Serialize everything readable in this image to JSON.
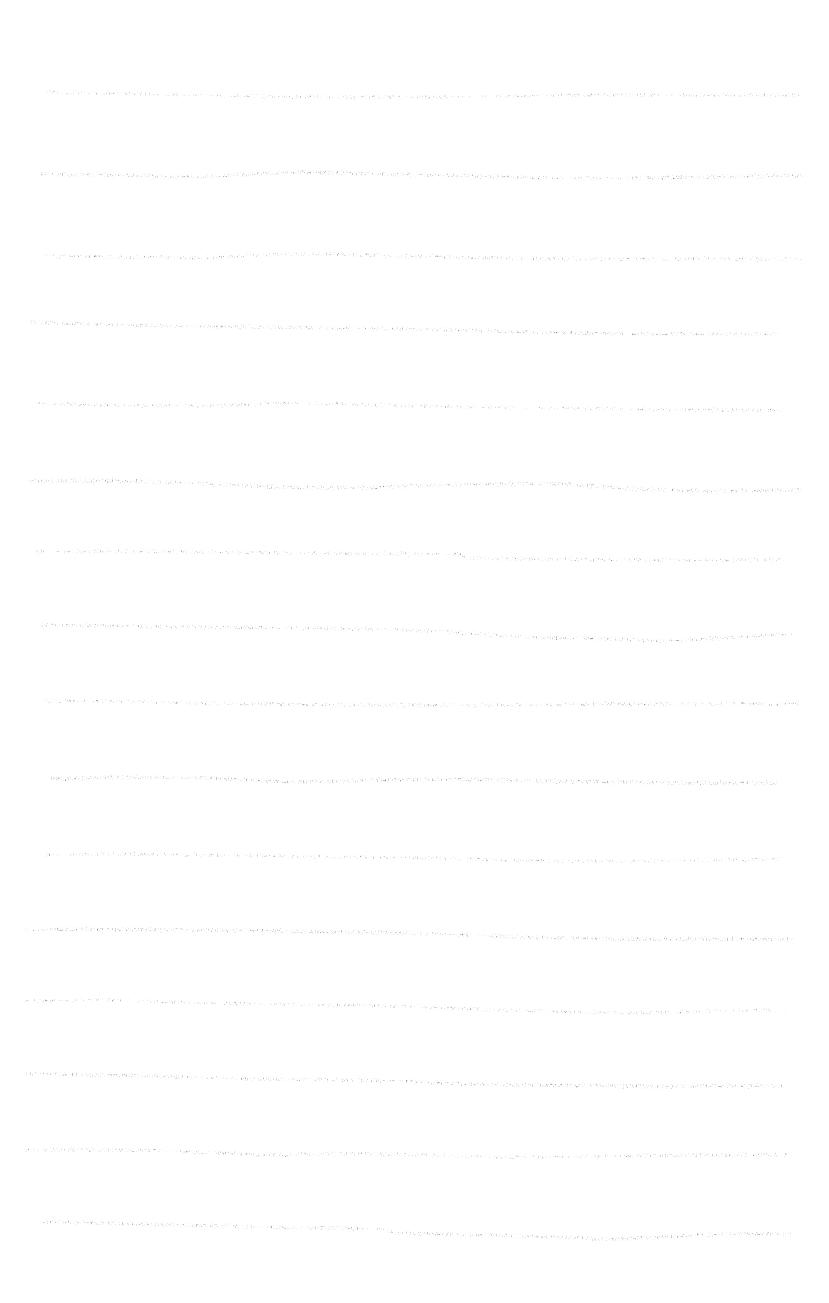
{
  "page": {
    "width": 829,
    "height": 1303,
    "background_color": "#ffffff",
    "ink_color": "#3a3a3a",
    "medium": "pencil-on-paper scan",
    "line_count": 16
  },
  "chart_data": {
    "type": "line",
    "xlabel": "",
    "ylabel": "",
    "xlim": [
      0,
      829
    ],
    "ylim": [
      0,
      1303
    ],
    "grid": false,
    "legend": "none",
    "series": [
      {
        "name": "rule-1",
        "index": 1,
        "y_baseline": 95,
        "x_start": 48,
        "x_end": 800,
        "stroke_width": 2.6,
        "opacity": 0.92,
        "points": [
          [
            48,
            92
          ],
          [
            70,
            93
          ],
          [
            150,
            94
          ],
          [
            240,
            96
          ],
          [
            330,
            97
          ],
          [
            420,
            97
          ],
          [
            500,
            96
          ],
          [
            580,
            95
          ],
          [
            660,
            95
          ],
          [
            740,
            95
          ],
          [
            800,
            95
          ]
        ],
        "gaps": [
          [
            178,
            232
          ],
          [
            455,
            500
          ],
          [
            530,
            548
          ]
        ],
        "lead_dashes": [
          [
            48,
            56
          ],
          [
            62,
            70
          ]
        ]
      },
      {
        "name": "rule-2",
        "index": 2,
        "y_baseline": 177,
        "x_start": 42,
        "x_end": 802,
        "stroke_width": 2.9,
        "opacity": 0.95,
        "points": [
          [
            42,
            174
          ],
          [
            110,
            175
          ],
          [
            190,
            177
          ],
          [
            250,
            174
          ],
          [
            300,
            172
          ],
          [
            380,
            174
          ],
          [
            470,
            176
          ],
          [
            540,
            178
          ],
          [
            620,
            178
          ],
          [
            700,
            177
          ],
          [
            760,
            176
          ],
          [
            802,
            176
          ]
        ],
        "gaps": [
          [
            545,
            575
          ],
          [
            598,
            620
          ]
        ],
        "lead_dashes": []
      },
      {
        "name": "rule-3",
        "index": 3,
        "y_baseline": 258,
        "x_start": 44,
        "x_end": 800,
        "stroke_width": 2.8,
        "opacity": 0.94,
        "points": [
          [
            44,
            256
          ],
          [
            120,
            257
          ],
          [
            200,
            258
          ],
          [
            265,
            255
          ],
          [
            320,
            254
          ],
          [
            400,
            256
          ],
          [
            490,
            258
          ],
          [
            570,
            259
          ],
          [
            650,
            259
          ],
          [
            730,
            259
          ],
          [
            800,
            259
          ]
        ],
        "gaps": [],
        "lead_dashes": []
      },
      {
        "name": "rule-4",
        "index": 4,
        "y_baseline": 326,
        "x_start": 30,
        "x_end": 780,
        "stroke_width": 2.6,
        "opacity": 0.9,
        "points": [
          [
            30,
            322
          ],
          [
            90,
            324
          ],
          [
            170,
            326
          ],
          [
            250,
            327
          ],
          [
            330,
            328
          ],
          [
            410,
            329
          ],
          [
            490,
            331
          ],
          [
            570,
            333
          ],
          [
            650,
            334
          ],
          [
            720,
            334
          ],
          [
            780,
            334
          ]
        ],
        "gaps": [
          [
            118,
            136
          ],
          [
            176,
            198
          ],
          [
            352,
            372
          ]
        ],
        "lead_dashes": []
      },
      {
        "name": "rule-5",
        "index": 5,
        "y_baseline": 406,
        "x_start": 38,
        "x_end": 782,
        "stroke_width": 2.7,
        "opacity": 0.93,
        "points": [
          [
            38,
            404
          ],
          [
            110,
            405
          ],
          [
            190,
            406
          ],
          [
            262,
            404
          ],
          [
            300,
            403
          ],
          [
            380,
            405
          ],
          [
            460,
            407
          ],
          [
            540,
            408
          ],
          [
            620,
            409
          ],
          [
            700,
            410
          ],
          [
            782,
            410
          ]
        ],
        "gaps": [
          [
            48,
            62
          ],
          [
            528,
            548
          ]
        ],
        "lead_dashes": [
          [
            38,
            46
          ]
        ]
      },
      {
        "name": "rule-6",
        "index": 6,
        "y_baseline": 483,
        "x_start": 30,
        "x_end": 800,
        "stroke_width": 3.0,
        "opacity": 0.95,
        "points": [
          [
            30,
            481
          ],
          [
            110,
            481
          ],
          [
            190,
            483
          ],
          [
            280,
            487
          ],
          [
            360,
            488
          ],
          [
            430,
            485
          ],
          [
            500,
            484
          ],
          [
            560,
            484
          ],
          [
            640,
            489
          ],
          [
            720,
            491
          ],
          [
            800,
            490
          ]
        ],
        "gaps": [
          [
            175,
            196
          ],
          [
            345,
            362
          ]
        ],
        "lead_dashes": [
          [
            30,
            40
          ]
        ]
      },
      {
        "name": "rule-7",
        "index": 7,
        "y_baseline": 555,
        "x_start": 36,
        "x_end": 782,
        "stroke_width": 2.8,
        "opacity": 0.94,
        "points": [
          [
            36,
            552
          ],
          [
            110,
            551
          ],
          [
            200,
            552
          ],
          [
            290,
            553
          ],
          [
            380,
            554
          ],
          [
            455,
            554
          ],
          [
            470,
            558
          ],
          [
            540,
            559
          ],
          [
            620,
            560
          ],
          [
            700,
            560
          ],
          [
            782,
            560
          ]
        ],
        "gaps": [
          [
            50,
            66
          ],
          [
            290,
            312
          ],
          [
            420,
            452
          ]
        ],
        "lead_dashes": [
          [
            36,
            46
          ]
        ]
      },
      {
        "name": "rule-8",
        "index": 8,
        "y_baseline": 628,
        "x_start": 42,
        "x_end": 790,
        "stroke_width": 2.7,
        "opacity": 0.92,
        "points": [
          [
            42,
            625
          ],
          [
            120,
            626
          ],
          [
            200,
            627
          ],
          [
            290,
            628
          ],
          [
            370,
            629
          ],
          [
            450,
            632
          ],
          [
            530,
            637
          ],
          [
            610,
            639
          ],
          [
            660,
            641
          ],
          [
            720,
            638
          ],
          [
            790,
            634
          ]
        ],
        "gaps": [
          [
            52,
            66
          ],
          [
            74,
            86
          ],
          [
            265,
            290
          ],
          [
            372,
            392
          ]
        ],
        "lead_dashes": [
          [
            42,
            50
          ],
          [
            58,
            70
          ],
          [
            78,
            90
          ]
        ]
      },
      {
        "name": "rule-9",
        "index": 9,
        "y_baseline": 703,
        "x_start": 44,
        "x_end": 800,
        "stroke_width": 2.8,
        "opacity": 0.93,
        "points": [
          [
            44,
            701
          ],
          [
            110,
            701
          ],
          [
            190,
            703
          ],
          [
            270,
            704
          ],
          [
            350,
            705
          ],
          [
            430,
            705
          ],
          [
            510,
            705
          ],
          [
            590,
            704
          ],
          [
            670,
            704
          ],
          [
            740,
            704
          ],
          [
            800,
            704
          ]
        ],
        "gaps": [
          [
            75,
            95
          ],
          [
            115,
            140
          ]
        ],
        "lead_dashes": [
          [
            44,
            54
          ]
        ]
      },
      {
        "name": "rule-10",
        "index": 10,
        "y_baseline": 781,
        "x_start": 50,
        "x_end": 775,
        "stroke_width": 2.9,
        "opacity": 0.95,
        "points": [
          [
            50,
            779
          ],
          [
            120,
            777
          ],
          [
            200,
            778
          ],
          [
            265,
            781
          ],
          [
            300,
            782
          ],
          [
            380,
            780
          ],
          [
            460,
            779
          ],
          [
            540,
            781
          ],
          [
            620,
            782
          ],
          [
            700,
            783
          ],
          [
            775,
            783
          ]
        ],
        "gaps": [
          [
            172,
            196
          ]
        ],
        "lead_dashes": []
      },
      {
        "name": "rule-11",
        "index": 11,
        "y_baseline": 858,
        "x_start": 44,
        "x_end": 785,
        "stroke_width": 2.5,
        "opacity": 0.88,
        "points": [
          [
            44,
            855
          ],
          [
            110,
            854
          ],
          [
            190,
            855
          ],
          [
            270,
            856
          ],
          [
            350,
            857
          ],
          [
            430,
            858
          ],
          [
            500,
            860
          ],
          [
            560,
            861
          ],
          [
            640,
            861
          ],
          [
            720,
            860
          ],
          [
            785,
            859
          ]
        ],
        "gaps": [
          [
            52,
            70
          ]
        ],
        "lead_dashes": [
          [
            44,
            52
          ]
        ]
      },
      {
        "name": "rule-12",
        "index": 12,
        "y_baseline": 932,
        "x_start": 26,
        "x_end": 790,
        "stroke_width": 2.9,
        "opacity": 0.95,
        "points": [
          [
            26,
            930
          ],
          [
            100,
            929
          ],
          [
            180,
            930
          ],
          [
            260,
            931
          ],
          [
            340,
            932
          ],
          [
            420,
            933
          ],
          [
            490,
            936
          ],
          [
            560,
            938
          ],
          [
            640,
            939
          ],
          [
            720,
            939
          ],
          [
            790,
            939
          ]
        ],
        "gaps": [
          [
            36,
            52
          ],
          [
            430,
            462
          ],
          [
            470,
            492
          ]
        ],
        "lead_dashes": [
          [
            26,
            36
          ]
        ]
      },
      {
        "name": "rule-13",
        "index": 13,
        "y_baseline": 1005,
        "x_start": 26,
        "x_end": 785,
        "stroke_width": 2.7,
        "opacity": 0.92,
        "points": [
          [
            26,
            1001
          ],
          [
            100,
            1000
          ],
          [
            180,
            1002
          ],
          [
            260,
            1004
          ],
          [
            340,
            1005
          ],
          [
            420,
            1007
          ],
          [
            500,
            1010
          ],
          [
            570,
            1012
          ],
          [
            640,
            1013
          ],
          [
            710,
            1011
          ],
          [
            785,
            1010
          ]
        ],
        "gaps": [
          [
            255,
            282
          ]
        ],
        "lead_dashes": []
      },
      {
        "name": "rule-14",
        "index": 14,
        "y_baseline": 1078,
        "x_start": 28,
        "x_end": 782,
        "stroke_width": 2.8,
        "opacity": 0.93,
        "points": [
          [
            28,
            1074
          ],
          [
            100,
            1075
          ],
          [
            180,
            1077
          ],
          [
            260,
            1079
          ],
          [
            340,
            1080
          ],
          [
            400,
            1081
          ],
          [
            460,
            1084
          ],
          [
            540,
            1085
          ],
          [
            620,
            1086
          ],
          [
            700,
            1086
          ],
          [
            782,
            1086
          ]
        ],
        "gaps": [
          [
            196,
            232
          ],
          [
            380,
            402
          ]
        ],
        "lead_dashes": []
      },
      {
        "name": "rule-15",
        "index": 15,
        "y_baseline": 1152,
        "x_start": 28,
        "x_end": 790,
        "stroke_width": 3.0,
        "opacity": 0.95,
        "points": [
          [
            28,
            1150
          ],
          [
            100,
            1150
          ],
          [
            160,
            1151
          ],
          [
            230,
            1153
          ],
          [
            260,
            1155
          ],
          [
            300,
            1154
          ],
          [
            380,
            1154
          ],
          [
            460,
            1156
          ],
          [
            540,
            1157
          ],
          [
            620,
            1156
          ],
          [
            700,
            1155
          ],
          [
            790,
            1155
          ]
        ],
        "gaps": [
          [
            160,
            178
          ],
          [
            545,
            580
          ],
          [
            608,
            636
          ]
        ],
        "lead_dashes": []
      },
      {
        "name": "rule-16",
        "index": 16,
        "y_baseline": 1228,
        "x_start": 45,
        "x_end": 790,
        "stroke_width": 2.8,
        "opacity": 0.93,
        "points": [
          [
            45,
            1222
          ],
          [
            100,
            1223
          ],
          [
            180,
            1225
          ],
          [
            260,
            1227
          ],
          [
            330,
            1228
          ],
          [
            380,
            1229
          ],
          [
            400,
            1233
          ],
          [
            480,
            1235
          ],
          [
            560,
            1237
          ],
          [
            610,
            1239
          ],
          [
            680,
            1236
          ],
          [
            740,
            1234
          ],
          [
            790,
            1234
          ]
        ],
        "gaps": [
          [
            50,
            64
          ],
          [
            72,
            88
          ],
          [
            252,
            272
          ],
          [
            288,
            308
          ],
          [
            360,
            390
          ]
        ],
        "lead_dashes": [
          [
            45,
            52
          ],
          [
            58,
            66
          ],
          [
            72,
            86
          ]
        ]
      }
    ]
  }
}
